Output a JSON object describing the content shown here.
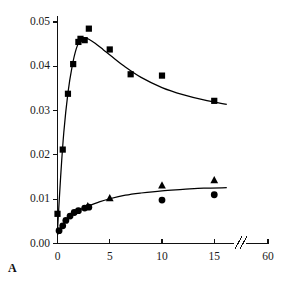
{
  "panel": {
    "label": "A"
  },
  "chart_data": {
    "type": "scatter",
    "title": "",
    "xlabel": "",
    "ylabel": "",
    "xlim": [
      0,
      17.2
    ],
    "ylim": [
      0,
      0.05
    ],
    "grid": false,
    "legend": "none",
    "axis_break": {
      "present": true,
      "symbol": "//",
      "after_tick": 15,
      "before_tick": 60
    },
    "xticks": [
      0,
      5,
      10,
      15,
      60
    ],
    "xtick_labels": [
      "0",
      "5",
      "10",
      "15",
      "60"
    ],
    "yticks": [
      0.0,
      0.01,
      0.02,
      0.03,
      0.04,
      0.05
    ],
    "ytick_labels": [
      "0.00",
      "0.01",
      "0.02",
      "0.03",
      "0.04",
      "0.05"
    ],
    "series": [
      {
        "name": "squares",
        "marker": "square",
        "color": "#000000",
        "points": [
          {
            "x": 0.0,
            "y": 0.0067
          },
          {
            "x": 0.5,
            "y": 0.0212
          },
          {
            "x": 1.0,
            "y": 0.0338
          },
          {
            "x": 1.5,
            "y": 0.0405
          },
          {
            "x": 2.0,
            "y": 0.0455
          },
          {
            "x": 2.2,
            "y": 0.0462
          },
          {
            "x": 2.6,
            "y": 0.0459
          },
          {
            "x": 3.0,
            "y": 0.0485
          },
          {
            "x": 5.0,
            "y": 0.0438
          },
          {
            "x": 7.0,
            "y": 0.0382
          },
          {
            "x": 10.0,
            "y": 0.0379
          },
          {
            "x": 15.0,
            "y": 0.0322
          }
        ],
        "fit_curve": [
          {
            "x": 0.0,
            "y": 0.003
          },
          {
            "x": 0.3,
            "y": 0.015
          },
          {
            "x": 0.6,
            "y": 0.025
          },
          {
            "x": 1.0,
            "y": 0.034
          },
          {
            "x": 1.4,
            "y": 0.04
          },
          {
            "x": 1.8,
            "y": 0.044
          },
          {
            "x": 2.2,
            "y": 0.046
          },
          {
            "x": 2.6,
            "y": 0.0464
          },
          {
            "x": 3.0,
            "y": 0.0461
          },
          {
            "x": 3.6,
            "y": 0.0452
          },
          {
            "x": 4.4,
            "y": 0.0437
          },
          {
            "x": 5.2,
            "y": 0.0422
          },
          {
            "x": 6.4,
            "y": 0.04
          },
          {
            "x": 8.0,
            "y": 0.0375
          },
          {
            "x": 10.0,
            "y": 0.0352
          },
          {
            "x": 12.0,
            "y": 0.0336
          },
          {
            "x": 14.0,
            "y": 0.0324
          },
          {
            "x": 16.2,
            "y": 0.0314
          }
        ]
      },
      {
        "name": "circles",
        "marker": "circle",
        "color": "#000000",
        "points": [
          {
            "x": 0.15,
            "y": 0.0029
          },
          {
            "x": 0.5,
            "y": 0.004
          },
          {
            "x": 0.8,
            "y": 0.0052
          },
          {
            "x": 1.2,
            "y": 0.0062
          },
          {
            "x": 1.6,
            "y": 0.007
          },
          {
            "x": 2.0,
            "y": 0.0074
          },
          {
            "x": 2.6,
            "y": 0.008
          },
          {
            "x": 3.0,
            "y": 0.0082
          },
          {
            "x": 10.0,
            "y": 0.0098
          },
          {
            "x": 15.0,
            "y": 0.011
          }
        ],
        "fit_curve": [
          {
            "x": 0.0,
            "y": 0.002
          },
          {
            "x": 0.3,
            "y": 0.0032
          },
          {
            "x": 0.7,
            "y": 0.0048
          },
          {
            "x": 1.1,
            "y": 0.0059
          },
          {
            "x": 1.6,
            "y": 0.0069
          },
          {
            "x": 2.2,
            "y": 0.0077
          },
          {
            "x": 3.0,
            "y": 0.0085
          },
          {
            "x": 4.0,
            "y": 0.0094
          },
          {
            "x": 5.0,
            "y": 0.0101
          },
          {
            "x": 6.5,
            "y": 0.0109
          },
          {
            "x": 8.0,
            "y": 0.0114
          },
          {
            "x": 10.0,
            "y": 0.0119
          },
          {
            "x": 12.0,
            "y": 0.0122
          },
          {
            "x": 14.0,
            "y": 0.0125
          },
          {
            "x": 16.2,
            "y": 0.0126
          }
        ]
      },
      {
        "name": "triangles",
        "marker": "triangle",
        "color": "#000000",
        "points": [
          {
            "x": 2.9,
            "y": 0.0084
          },
          {
            "x": 5.0,
            "y": 0.0102
          },
          {
            "x": 10.0,
            "y": 0.0131
          },
          {
            "x": 15.0,
            "y": 0.0143
          }
        ]
      }
    ]
  }
}
